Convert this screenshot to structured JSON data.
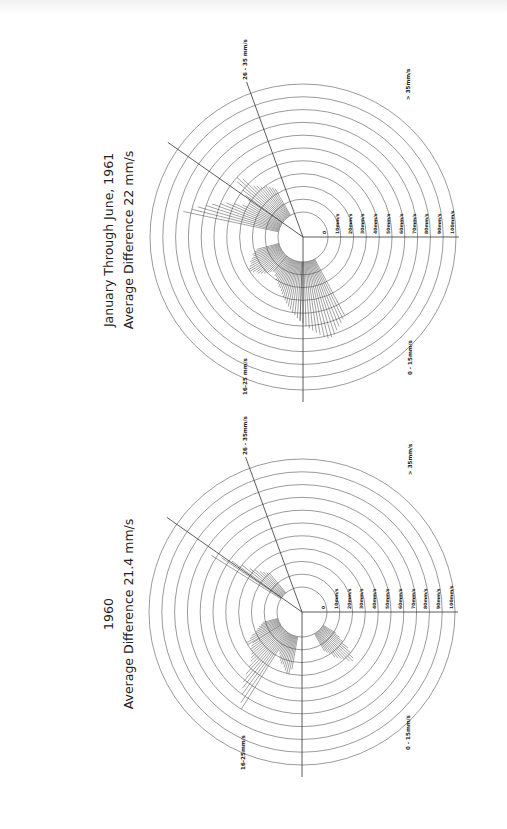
{
  "page": {
    "rotation_deg": -90,
    "background": "#ffffff"
  },
  "chart_data": [
    {
      "type": "polar-rose",
      "id": "chart-1961",
      "title": "January Through June, 1961",
      "subtitle": "Average Difference 22 mm/s",
      "radial_unit": "mm/s",
      "radial_ticks": [
        "0",
        "10mm/s",
        "20mm/s",
        "30mm/s",
        "40mm/s",
        "50mm/s",
        "60mm/s",
        "70mm/s",
        "80mm/s",
        "90mm/s",
        "100mm/s"
      ],
      "rlim": [
        0,
        100
      ],
      "sector_labels": [
        "0 - 15mm/s",
        "16-25 mm/s",
        "26 - 35 mm/s",
        "> 35mm/s"
      ],
      "sectors": [
        {
          "label": "0 - 15mm/s",
          "from_deg": 270,
          "to_deg": 0
        },
        {
          "label": "16-25 mm/s",
          "from_deg": 180,
          "to_deg": 270
        },
        {
          "label": "26 - 35 mm/s",
          "from_deg": 110,
          "to_deg": 180
        },
        {
          "label": "> 35mm/s",
          "from_deg": 0,
          "to_deg": 110
        }
      ],
      "rays": [
        {
          "from_deg": 195,
          "to_deg": 230,
          "step": 2,
          "values": [
            18,
            20,
            22,
            22,
            24,
            26,
            26,
            28,
            30,
            30,
            28,
            26,
            26,
            24,
            22,
            20,
            18,
            16
          ]
        },
        {
          "from_deg": 230,
          "to_deg": 268,
          "step": 2,
          "values": [
            16,
            16,
            18,
            18,
            20,
            20,
            22,
            24,
            24,
            26,
            28,
            30,
            32,
            34,
            36,
            38,
            40,
            42,
            44,
            46
          ]
        },
        {
          "from_deg": 268,
          "to_deg": 300,
          "step": 2,
          "values": [
            46,
            48,
            50,
            52,
            54,
            56,
            58,
            60,
            62,
            62,
            60,
            58,
            56,
            54,
            52,
            50
          ]
        },
        {
          "from_deg": 120,
          "to_deg": 150,
          "step": 2,
          "values": [
            24,
            26,
            28,
            30,
            30,
            32,
            34,
            36,
            46,
            50,
            48,
            40,
            36,
            32,
            30
          ]
        },
        {
          "from_deg": 150,
          "to_deg": 170,
          "step": 2,
          "values": [
            30,
            34,
            40,
            46,
            50,
            56,
            60,
            66,
            70,
            76
          ]
        }
      ],
      "notes": "Rays read approximately from radial extents against 10 mm/s rings."
    },
    {
      "type": "polar-rose",
      "id": "chart-1960",
      "title": "1960",
      "subtitle": "Average Difference 21.4 mm/s",
      "radial_unit": "mm/s",
      "radial_ticks": [
        "0",
        "10mm/s",
        "20mm/s",
        "30mm/s",
        "40mm/s",
        "50mm/s",
        "60mm/s",
        "70mm/s",
        "80mm/s",
        "90mm/s",
        "100mm/s"
      ],
      "rlim": [
        0,
        100
      ],
      "sector_labels": [
        "0 - 15mm/s",
        "16-25mm/s",
        "26 - 35mm/s",
        "> 35mm/s"
      ],
      "sectors": [
        {
          "label": "0 - 15mm/s",
          "from_deg": 270,
          "to_deg": 0
        },
        {
          "label": "16-25mm/s",
          "from_deg": 180,
          "to_deg": 270
        },
        {
          "label": "26 - 35mm/s",
          "from_deg": 110,
          "to_deg": 180
        },
        {
          "label": "> 35mm/s",
          "from_deg": 0,
          "to_deg": 110
        }
      ],
      "rays": [
        {
          "from_deg": 195,
          "to_deg": 212,
          "step": 2,
          "values": [
            12,
            14,
            16,
            18,
            20,
            24,
            26,
            30,
            30
          ]
        },
        {
          "from_deg": 212,
          "to_deg": 240,
          "step": 2,
          "values": [
            26,
            28,
            30,
            30,
            32,
            34,
            36,
            40,
            46,
            52,
            56,
            60,
            66,
            70
          ]
        },
        {
          "from_deg": 240,
          "to_deg": 262,
          "step": 2,
          "values": [
            16,
            18,
            20,
            22,
            24,
            24,
            26,
            28,
            30,
            30,
            26
          ]
        },
        {
          "from_deg": 300,
          "to_deg": 330,
          "step": 2,
          "values": [
            16,
            18,
            20,
            24,
            26,
            28,
            30,
            34,
            36,
            34,
            30,
            26,
            20,
            16,
            12
          ]
        },
        {
          "from_deg": 130,
          "to_deg": 150,
          "step": 2,
          "values": [
            20,
            22,
            24,
            26,
            30,
            34,
            40,
            48,
            56,
            64
          ]
        }
      ],
      "notes": "Rays read approximately from radial extents against 10 mm/s rings."
    }
  ]
}
